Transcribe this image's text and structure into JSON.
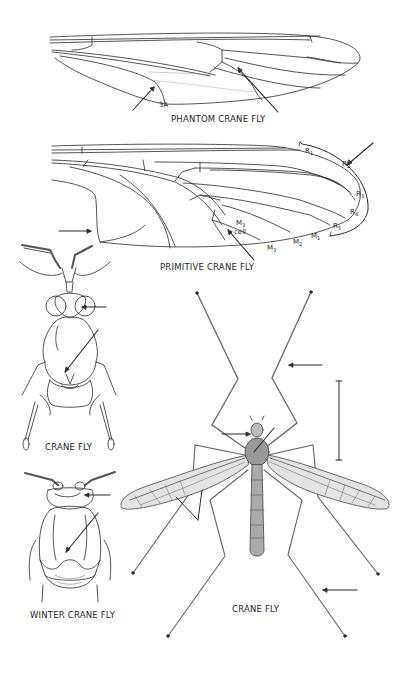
{
  "plate": {
    "figures": [
      {
        "id": "phantom-crane-fly-wing",
        "caption": "PHANTOM CRANE FLY",
        "labels": [
          "3A"
        ]
      },
      {
        "id": "primitive-crane-fly-wing",
        "caption": "PRIMITIVE CRANE FLY",
        "vein_labels": {
          "R1": "R",
          "R1_sub": "1",
          "R2": "R",
          "R2_sub": "2",
          "R3": "R",
          "R3_sub": "3",
          "R4": "R",
          "R4_sub": "4",
          "R5": "R",
          "R5_sub": "5",
          "M1": "M",
          "M1_sub": "1",
          "M2": "M",
          "M2_sub": "2",
          "M3": "M",
          "M3_sub": "3",
          "M3cell": "M",
          "M3cell_sub": "3",
          "cell": "cell"
        }
      },
      {
        "id": "crane-fly-thorax",
        "caption": "CRANE FLY"
      },
      {
        "id": "winter-crane-fly-thorax",
        "caption": "WINTER CRANE FLY"
      },
      {
        "id": "crane-fly-full",
        "caption": "CRANE FLY"
      }
    ],
    "colors": {
      "ink": "#2a2a2a",
      "background": "#ffffff",
      "wing_shade": "#d9d9d9"
    }
  }
}
